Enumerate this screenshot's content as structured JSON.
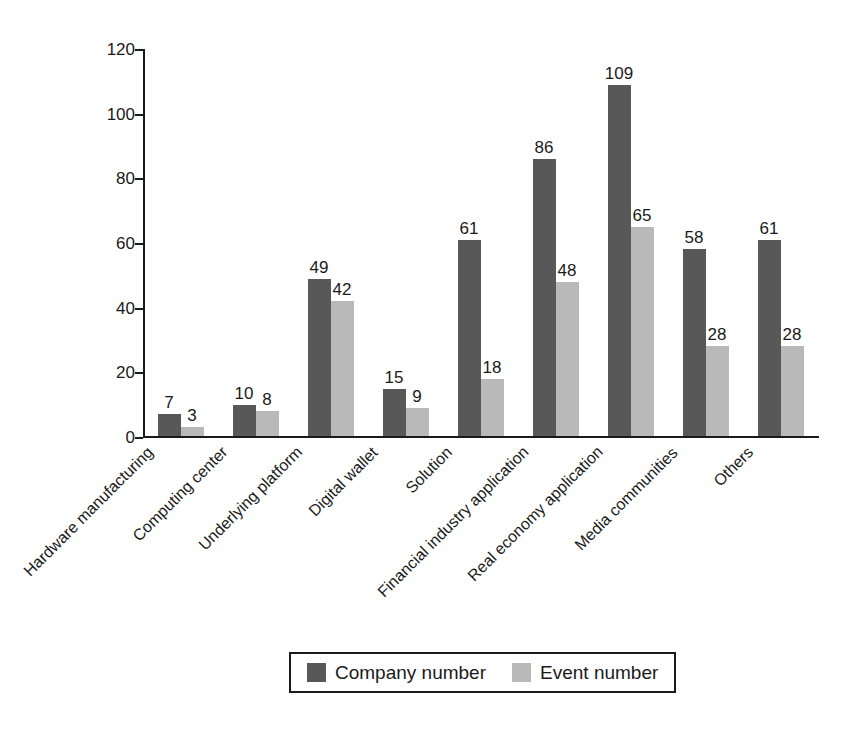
{
  "chart_data": {
    "type": "bar",
    "title": "",
    "subtitle": "",
    "xlabel": "",
    "ylabel": "",
    "ylim": [
      0,
      120
    ],
    "ytick_step": 20,
    "yticks": [
      0,
      20,
      40,
      60,
      80,
      100,
      120
    ],
    "grid": false,
    "legend_position": "bottom-center",
    "data_labels": true,
    "categories": [
      "Hardware manufacturing",
      "Computing center",
      "Underlying platform",
      "Digital wallet",
      "Solution",
      "Financial industry application",
      "Real economy application",
      "Media communities",
      "Others"
    ],
    "series": [
      {
        "name": "Company number",
        "color": "#585858",
        "values": [
          7,
          10,
          49,
          15,
          61,
          86,
          109,
          58,
          61
        ]
      },
      {
        "name": "Event number",
        "color": "#b9b9b9",
        "values": [
          3,
          8,
          42,
          9,
          18,
          48,
          65,
          28,
          28
        ]
      }
    ]
  },
  "legend": {
    "items": [
      {
        "label": "Company number",
        "color": "#585858"
      },
      {
        "label": "Event number",
        "color": "#b9b9b9"
      }
    ]
  },
  "axis": {
    "y_tick_labels": [
      "0",
      "20",
      "40",
      "60",
      "80",
      "100",
      "120"
    ]
  }
}
